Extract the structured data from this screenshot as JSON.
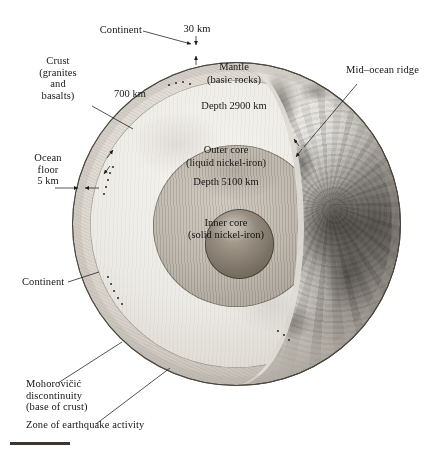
{
  "figure": {
    "background_color": "#ffffff",
    "ink_color": "#161616"
  },
  "callouts": {
    "continent_top": "Continent",
    "thickness_30km": "30 km",
    "crust": "Crust\n(granites\nand\nbasalts)",
    "mid_ocean_ridge": "Mid–ocean ridge",
    "ocean_floor": "Ocean\nfloor\n5 km",
    "continent_bottom": "Continent",
    "moho": "Mohorovičić\ndiscontinuity\n(base of crust)",
    "earthquake_zone": "Zone of earthquake activity"
  },
  "interior_labels": {
    "depth_700km": "700 km",
    "mantle_name": "Mantle",
    "mantle_composition": "(basic rocks)",
    "mantle_depth": "Depth 2900 km",
    "outer_core_name": "Outer core",
    "outer_core_composition": "(liquid nickel-iron)",
    "outer_core_depth": "Depth 5100 km",
    "inner_core_name": "Inner core",
    "inner_core_composition": "(solid nickel-iron)"
  },
  "layers": [
    {
      "name": "Crust",
      "composition": "granites and basalts",
      "thickness_continent_km": 30,
      "thickness_ocean_km": 5,
      "color": "#b9b3aa"
    },
    {
      "name": "Mantle",
      "composition": "basic rocks",
      "depth_km": 2900,
      "upper_boundary_km": 700,
      "color": "#eceae5"
    },
    {
      "name": "Outer core",
      "composition": "liquid nickel-iron",
      "depth_km": 5100,
      "color": "#bdb6ab"
    },
    {
      "name": "Inner core",
      "composition": "solid nickel-iron",
      "color": "#8e8578"
    }
  ]
}
